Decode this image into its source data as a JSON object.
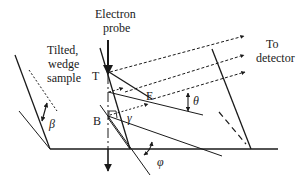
{
  "labels": {
    "probe_line1": "Electron",
    "probe_line2": "probe",
    "sample_line1": "Tilted,",
    "sample_line2": "wedge",
    "sample_line3": "sample",
    "detector_line1": "To",
    "detector_line2": "detector",
    "point_T": "T",
    "point_E": "E",
    "point_B": "B",
    "angle_beta": "β",
    "angle_theta": "θ",
    "angle_gamma": "γ",
    "angle_phi": "φ"
  },
  "colors": {
    "ink": "#1a1a1a",
    "background": "#ffffff"
  }
}
